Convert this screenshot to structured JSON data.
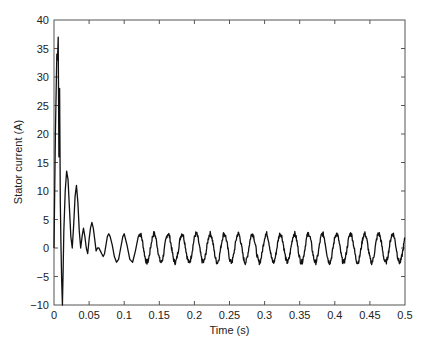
{
  "chart_data": {
    "type": "line",
    "title": "",
    "xlabel": "Time (s)",
    "ylabel": "Stator current (A)",
    "xlim": [
      0,
      0.5
    ],
    "ylim": [
      -10,
      40
    ],
    "grid": false,
    "legend": null,
    "x_ticks": [
      0,
      0.05,
      0.1,
      0.15,
      0.2,
      0.25,
      0.3,
      0.35,
      0.4,
      0.45,
      0.5
    ],
    "x_tick_labels": [
      "0",
      "0.05",
      "0.1",
      "0.15",
      "0.2",
      "0.25",
      "0.3",
      "0.35",
      "0.4",
      "0.45",
      "0.5"
    ],
    "y_ticks": [
      -10,
      -5,
      0,
      5,
      10,
      15,
      20,
      25,
      30,
      35,
      40
    ],
    "y_tick_labels": [
      "−10",
      "−5",
      "0",
      "5",
      "10",
      "15",
      "20",
      "25",
      "30",
      "35",
      "40"
    ],
    "series": [
      {
        "name": "Stator current",
        "color": "#111111",
        "description": "Startup transient with large inrush peaks (~37 A) decaying to a steady ~50 Hz sinusoid of amplitude ~2.5 A",
        "x": [
          0,
          0.002,
          0.004,
          0.005,
          0.006,
          0.007,
          0.008,
          0.009,
          0.01,
          0.011,
          0.012,
          0.013,
          0.014,
          0.016,
          0.018,
          0.02,
          0.022,
          0.024,
          0.026,
          0.028,
          0.03,
          0.032,
          0.034,
          0.036,
          0.038,
          0.04,
          0.042,
          0.044,
          0.046,
          0.048,
          0.05,
          0.052,
          0.054,
          0.056,
          0.058,
          0.06,
          0.062,
          0.064,
          0.066,
          0.068,
          0.07,
          0.072,
          0.074,
          0.076,
          0.078,
          0.08,
          0.083,
          0.086,
          0.089,
          0.092,
          0.095,
          0.098,
          0.1,
          0.104,
          0.108,
          0.112,
          0.116,
          0.12
        ],
        "y": [
          0,
          20,
          34,
          33,
          37,
          16,
          28,
          8,
          0,
          -6,
          -10,
          -4,
          3,
          10,
          13.5,
          12,
          7,
          2,
          0,
          4,
          9,
          11,
          8,
          3,
          0,
          2,
          3.5,
          2,
          0,
          -1,
          1.5,
          3.5,
          4.5,
          3.5,
          1.5,
          -0.5,
          0,
          0,
          -0.5,
          -1,
          -1.5,
          -1,
          0.5,
          2,
          2.5,
          2,
          0.5,
          -1.5,
          -2.5,
          -2,
          0,
          2,
          2.5,
          0.5,
          -2,
          -2.5,
          -0.5,
          2
        ],
        "steady_state": {
          "start_s": 0.1,
          "frequency_hz": 50,
          "amplitude_a": 2.5,
          "offset_a": 0
        }
      }
    ]
  }
}
